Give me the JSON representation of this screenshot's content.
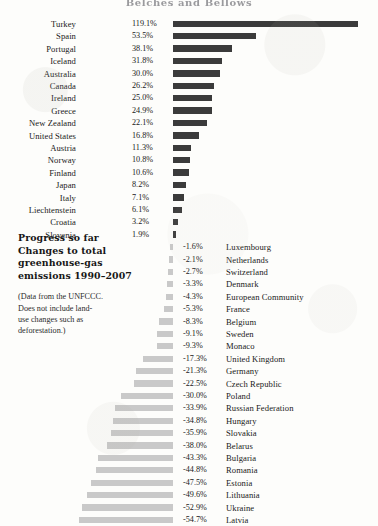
{
  "chart": {
    "title": "Belches and Bellows",
    "caption": {
      "heading_lines": [
        "Progress so far",
        "Changes to total",
        "greenhouse-gas",
        "emissions 1990–2007"
      ],
      "note_lines": [
        "(Data from the UNFCCC.",
        "Does not include land-",
        "use changes such as",
        "deforestation.)"
      ]
    },
    "colors": {
      "positive_bar": "#3b3b3b",
      "negative_bar": "#c9c9c9",
      "background": "#fdfdfb",
      "text": "#1a1a1a"
    }
  },
  "chart_data": {
    "type": "bar",
    "orientation": "horizontal",
    "title": "Belches and Bellows",
    "subtitle": "Progress so far — Changes to total greenhouse-gas emissions 1990–2007",
    "xlabel": "Change in total greenhouse-gas emissions, 1990–2007 (%)",
    "ylabel": "",
    "xlim": [
      -60,
      125
    ],
    "grid": false,
    "legend": null,
    "unit": "%",
    "annotations": [
      "(Data from the UNFCCC. Does not include land-use changes such as deforestation.)"
    ],
    "categories": [
      "Turkey",
      "Spain",
      "Portugal",
      "Iceland",
      "Australia",
      "Canada",
      "Ireland",
      "Greece",
      "New Zealand",
      "United States",
      "Austria",
      "Norway",
      "Finland",
      "Japan",
      "Italy",
      "Liechtenstein",
      "Croatia",
      "Slovenia",
      "Luxembourg",
      "Netherlands",
      "Switzerland",
      "Denmark",
      "European Community",
      "France",
      "Belgium",
      "Sweden",
      "Monaco",
      "United Kingdom",
      "Germany",
      "Czech Republic",
      "Poland",
      "Russian Federation",
      "Hungary",
      "Slovakia",
      "Belarus",
      "Bulgaria",
      "Romania",
      "Estonia",
      "Lithuania",
      "Ukraine",
      "Latvia"
    ],
    "values": [
      119.1,
      53.5,
      38.1,
      31.8,
      30.0,
      26.2,
      25.0,
      24.9,
      22.1,
      16.8,
      11.3,
      10.8,
      10.6,
      8.2,
      7.1,
      6.1,
      3.2,
      1.9,
      -1.6,
      -2.1,
      -2.7,
      -3.3,
      -4.3,
      -5.3,
      -8.3,
      -9.1,
      -9.3,
      -17.3,
      -21.3,
      -22.5,
      -30.0,
      -33.9,
      -34.8,
      -35.9,
      -38.0,
      -43.3,
      -44.8,
      -47.5,
      -49.6,
      -52.9,
      -54.7
    ],
    "value_labels": [
      "119.1%",
      "53.5%",
      "38.1%",
      "31.8%",
      "30.0%",
      "26.2%",
      "25.0%",
      "24.9%",
      "22.1%",
      "16.8%",
      "11.3%",
      "10.8%",
      "10.6%",
      "8.2%",
      "7.1%",
      "6.1%",
      "3.2%",
      "1.9%",
      "-1.6%",
      "-2.1%",
      "-2.7%",
      "-3.3%",
      "-4.3%",
      "-5.3%",
      "-8.3%",
      "-9.1%",
      "-9.3%",
      "-17.3%",
      "-21.3%",
      "-22.5%",
      "-30.0%",
      "-33.9%",
      "-34.8%",
      "-35.9%",
      "-38.0%",
      "-43.3%",
      "-44.8%",
      "-47.5%",
      "-49.6%",
      "-52.9%",
      "-54.7%"
    ]
  }
}
